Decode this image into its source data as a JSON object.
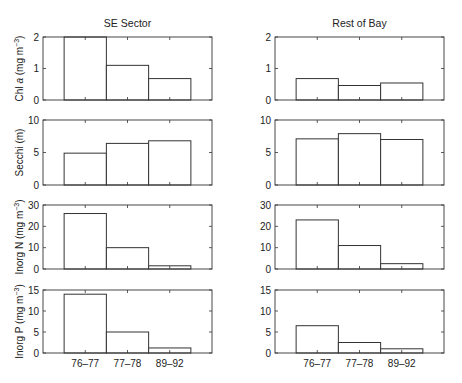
{
  "chart_data": [
    {
      "type": "bar",
      "panel": "SE Sector",
      "title": "SE Sector",
      "variable": "Chl a",
      "ylabel": "Chl a (mg m^-3)",
      "categories": [
        "76–77",
        "77–78",
        "89–92"
      ],
      "values": [
        2.0,
        1.1,
        0.68
      ],
      "ylim": [
        0,
        2
      ],
      "yticks": [
        0,
        1,
        2
      ],
      "grid": false
    },
    {
      "type": "bar",
      "panel": "Rest of Bay",
      "title": "Rest of Bay",
      "variable": "Chl a",
      "ylabel": "",
      "categories": [
        "76–77",
        "77–78",
        "89–92"
      ],
      "values": [
        0.68,
        0.46,
        0.54
      ],
      "ylim": [
        0,
        2
      ],
      "yticks": [
        0,
        1,
        2
      ],
      "grid": false
    },
    {
      "type": "bar",
      "panel": "SE Sector",
      "variable": "Secchi",
      "ylabel": "Secchi (m)",
      "categories": [
        "76–77",
        "77–78",
        "89–92"
      ],
      "values": [
        4.9,
        6.4,
        6.8
      ],
      "ylim": [
        0,
        10
      ],
      "yticks": [
        0,
        5,
        10
      ],
      "grid": false
    },
    {
      "type": "bar",
      "panel": "Rest of Bay",
      "variable": "Secchi",
      "ylabel": "",
      "categories": [
        "76–77",
        "77–78",
        "89–92"
      ],
      "values": [
        7.1,
        7.9,
        7.0
      ],
      "ylim": [
        0,
        10
      ],
      "yticks": [
        0,
        5,
        10
      ],
      "grid": false
    },
    {
      "type": "bar",
      "panel": "SE Sector",
      "variable": "Inorg N",
      "ylabel": "Inorg N (mg m^-3)",
      "categories": [
        "76–77",
        "77–78",
        "89–92"
      ],
      "values": [
        26,
        10,
        1.5
      ],
      "ylim": [
        0,
        30
      ],
      "yticks": [
        0,
        10,
        20,
        30
      ],
      "grid": false
    },
    {
      "type": "bar",
      "panel": "Rest of Bay",
      "variable": "Inorg N",
      "ylabel": "",
      "categories": [
        "76–77",
        "77–78",
        "89–92"
      ],
      "values": [
        23,
        11,
        2.5
      ],
      "ylim": [
        0,
        30
      ],
      "yticks": [
        0,
        10,
        20,
        30
      ],
      "grid": false
    },
    {
      "type": "bar",
      "panel": "SE Sector",
      "variable": "Inorg P",
      "ylabel": "Inorg P (mg m^-3)",
      "categories": [
        "76–77",
        "77–78",
        "89–92"
      ],
      "values": [
        14,
        5,
        1.2
      ],
      "ylim": [
        0,
        15
      ],
      "yticks": [
        0,
        5,
        10,
        15
      ],
      "grid": false
    },
    {
      "type": "bar",
      "panel": "Rest of Bay",
      "variable": "Inorg P",
      "ylabel": "",
      "categories": [
        "76–77",
        "77–78",
        "89–92"
      ],
      "values": [
        6.5,
        2.5,
        1.0
      ],
      "ylim": [
        0,
        15
      ],
      "yticks": [
        0,
        5,
        10,
        15
      ],
      "grid": false
    }
  ],
  "columns": {
    "left_title": "SE Sector",
    "right_title": "Rest of Bay"
  },
  "rows": [
    {
      "ylabel_main": "Chl ",
      "ylabel_italic": "a",
      "ylabel_unit": " (mg m",
      "ylabel_sup": "−3",
      "ylabel_close": ")"
    },
    {
      "ylabel_main": "Secchi (m)",
      "ylabel_italic": "",
      "ylabel_unit": "",
      "ylabel_sup": "",
      "ylabel_close": ""
    },
    {
      "ylabel_main": "Inorg N",
      "ylabel_italic": "",
      "ylabel_unit": " (mg m",
      "ylabel_sup": "−3",
      "ylabel_close": ")"
    },
    {
      "ylabel_main": "Inorg P",
      "ylabel_italic": "",
      "ylabel_unit": " (mg m",
      "ylabel_sup": "−3",
      "ylabel_close": ")"
    }
  ],
  "x_tick_labels": [
    "76–77",
    "77–78",
    "89–92"
  ],
  "colors": {
    "axis": "#333333",
    "bar_fill": "#ffffff",
    "bar_edge": "#333333",
    "text": "#222222"
  }
}
